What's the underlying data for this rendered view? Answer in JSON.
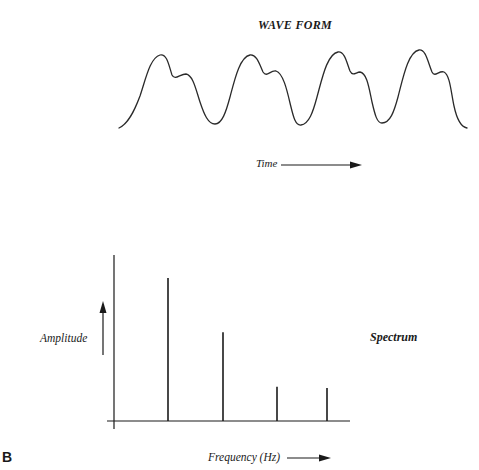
{
  "figure": {
    "panel_letter": "B",
    "waveform": {
      "title": "WAVE FORM",
      "x_arrow_label": "Time",
      "cycles": 4,
      "path_points": [
        [
          119,
          128
        ],
        [
          161,
          55
        ],
        [
          172,
          77
        ],
        [
          186,
          74
        ],
        [
          215,
          124
        ],
        [
          250,
          55
        ],
        [
          263,
          74
        ],
        [
          275,
          71
        ],
        [
          300,
          125
        ],
        [
          338,
          52
        ],
        [
          350,
          73
        ],
        [
          358,
          72
        ],
        [
          381,
          123
        ],
        [
          420,
          50
        ],
        [
          432,
          74
        ],
        [
          443,
          72
        ],
        [
          467,
          128
        ]
      ]
    },
    "spectrum": {
      "label": "Spectrum",
      "y_axis_label": "Amplitude",
      "x_axis_label": "Frequency (Hz)"
    },
    "colors": {
      "ink": "#1a1a1a",
      "background": "#ffffff"
    }
  },
  "chart_data": [
    {
      "type": "line",
      "title": "WAVE FORM",
      "xlabel": "Time",
      "ylabel": "",
      "description": "Periodic complex waveform, 4 cycles; each cycle has a main peak followed by a smaller shoulder peak",
      "grid": false,
      "axes_visible": false
    },
    {
      "type": "bar",
      "title": "Spectrum",
      "xlabel": "Frequency (Hz)",
      "ylabel": "Amplitude",
      "categories": [
        "f1",
        "f2",
        "f3",
        "f4"
      ],
      "values": [
        1.0,
        0.62,
        0.24,
        0.23
      ],
      "value_units": "relative amplitude (normalized, no tick labels shown)",
      "grid": false,
      "legend": "none"
    }
  ]
}
